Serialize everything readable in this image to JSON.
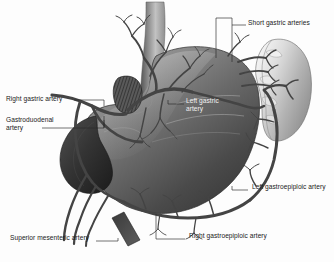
{
  "figure": {
    "type": "anatomical-illustration",
    "background_color": "#fdfdfd",
    "ink_color": "#1a1a1a",
    "artery_color": "#4a4a4a",
    "organ_dark": "#3a3a3a",
    "organ_mid": "#7d7d7d",
    "organ_light": "#d8d8d8"
  },
  "labels": [
    {
      "id": "short-gastric-arteries",
      "text": "Short gastric arteries",
      "lines": [
        "Short gastric arteries"
      ],
      "x": 248,
      "y": 22,
      "align": "left"
    },
    {
      "id": "right-gastric-artery",
      "text": "Right gastric artery",
      "lines": [
        "Right gastric artery"
      ],
      "x": 6,
      "y": 98,
      "align": "left"
    },
    {
      "id": "gastroduodenal-artery",
      "text": "Gastroduodenal artery",
      "lines": [
        "Gastroduodenal",
        "artery"
      ],
      "x": 6,
      "y": 118,
      "align": "left"
    },
    {
      "id": "left-gastric-artery",
      "text": "Left gastric artery",
      "lines": [
        "Left gastric",
        "artery"
      ],
      "x": 186,
      "y": 100,
      "align": "left"
    },
    {
      "id": "left-gastroepiploic-artery",
      "text": "Left gastroepiploic artery",
      "lines": [
        "Left gastroepiploic artery"
      ],
      "x": 250,
      "y": 186,
      "align": "left"
    },
    {
      "id": "right-gastroepiploic-artery",
      "text": "Right gastroepiploic artery",
      "lines": [
        "Right gastroepiploic artery"
      ],
      "x": 187,
      "y": 235,
      "align": "left"
    },
    {
      "id": "superior-mesenteric-artery",
      "text": "Superior mesenteric artery",
      "lines": [
        "Superior mesenteric artery"
      ],
      "x": 10,
      "y": 238,
      "align": "left"
    }
  ],
  "structures": [
    {
      "id": "esophagus",
      "name": "Esophagus"
    },
    {
      "id": "stomach",
      "name": "Stomach"
    },
    {
      "id": "spleen",
      "name": "Spleen"
    },
    {
      "id": "duodenum",
      "name": "Duodenum"
    },
    {
      "id": "diaphragm-crus",
      "name": "Diaphragmatic crus"
    },
    {
      "id": "celiac-trunk",
      "name": "Celiac trunk"
    }
  ]
}
